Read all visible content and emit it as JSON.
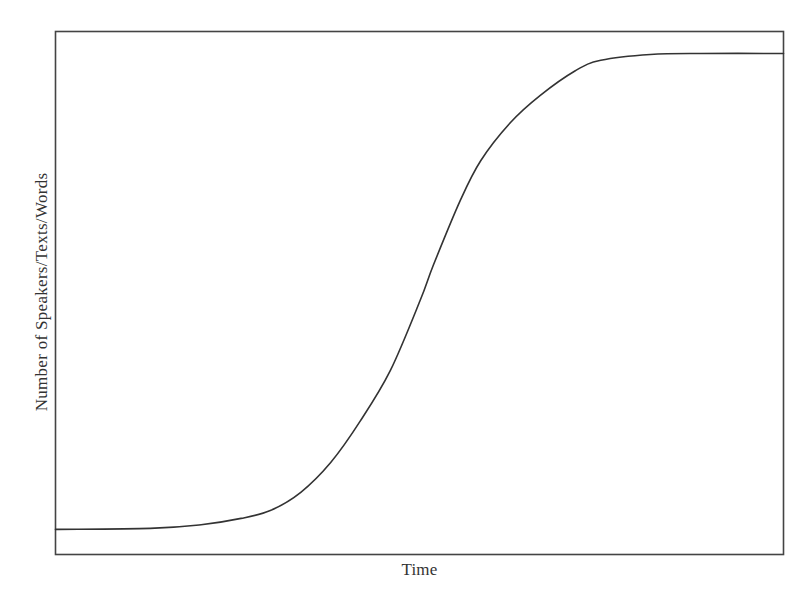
{
  "chart_data": {
    "type": "line",
    "title": "",
    "xlabel": "Time",
    "ylabel": "Number of Speakers/Texts/Words",
    "xlim": [
      0,
      100
    ],
    "ylim": [
      0,
      100
    ],
    "x_ticks": [],
    "y_ticks": [],
    "grid": false,
    "legend": null,
    "frame": "box",
    "units_note": "No numeric ticks shown; values normalized 0–100 along each axis",
    "series": [
      {
        "name": "S-curve",
        "color": "#333333",
        "x": [
          0,
          13,
          20,
          25.5,
          29.5,
          33.7,
          37.8,
          41.9,
          46,
          50.1,
          51.9,
          55.6,
          58.4,
          62.5,
          66.6,
          71.4,
          74.9,
          81.7,
          88.6,
          100
        ],
        "y": [
          4.8,
          5.0,
          5.7,
          6.9,
          8.4,
          11.9,
          17.6,
          25.6,
          35.2,
          48.6,
          55.3,
          67.7,
          75.3,
          82.6,
          87.8,
          92.5,
          94.5,
          95.6,
          95.8,
          95.8
        ]
      }
    ]
  },
  "axes": {
    "x_label": "Time",
    "y_label": "Number of Speakers/Texts/Words"
  },
  "colors": {
    "line": "#333333",
    "frame": "#444444",
    "background": "#ffffff"
  }
}
